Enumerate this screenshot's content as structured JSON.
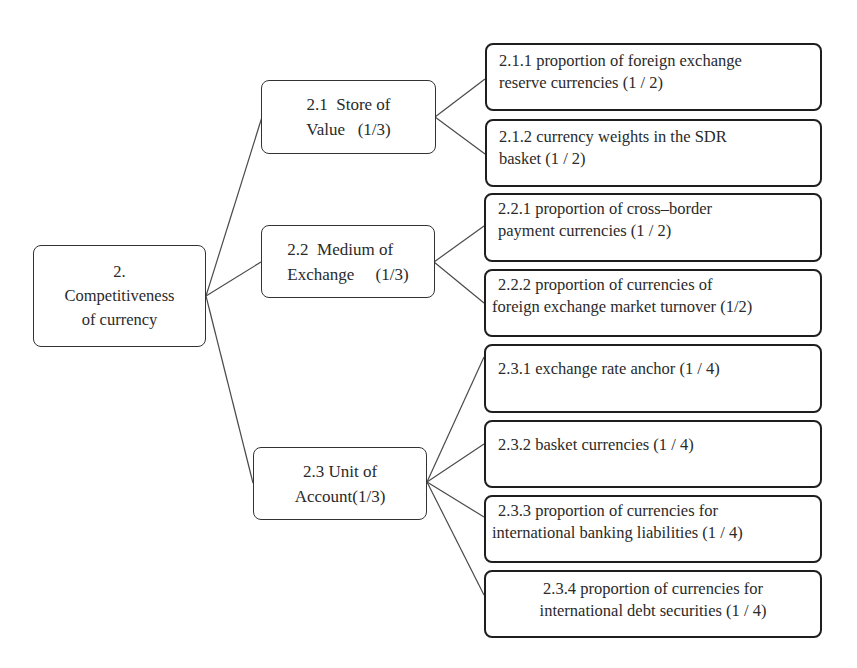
{
  "diagram": {
    "root": {
      "id": "2",
      "lines": [
        "2.",
        "Competitiveness",
        "of currency"
      ]
    },
    "branches": [
      {
        "id": "2.1",
        "lines": [
          "2.1  Store of",
          "Value   (1/3)"
        ],
        "label": "Store of Value",
        "weight": "1/3",
        "children": [
          {
            "id": "2.1.1",
            "lines": [
              "2.1.1 proportion of foreign exchange",
              "reserve currencies (1 / 2)"
            ],
            "weight": "1/2"
          },
          {
            "id": "2.1.2",
            "lines": [
              "2.1.2 currency weights in the SDR",
              "basket (1 / 2)"
            ],
            "weight": "1/2"
          }
        ]
      },
      {
        "id": "2.2",
        "lines": [
          "2.2  Medium of",
          "Exchange     (1/3)"
        ],
        "label": "Medium of Exchange",
        "weight": "1/3",
        "children": [
          {
            "id": "2.2.1",
            "lines": [
              "2.2.1 proportion of cross–border",
              "payment currencies (1 / 2)"
            ],
            "weight": "1/2"
          },
          {
            "id": "2.2.2",
            "lines": [
              "2.2.2 proportion of currencies of",
              "foreign exchange market turnover (1/2)"
            ],
            "weight": "1/2"
          }
        ]
      },
      {
        "id": "2.3",
        "lines": [
          "2.3 Unit of",
          "Account(1/3)"
        ],
        "label": "Unit of Account",
        "weight": "1/3",
        "children": [
          {
            "id": "2.3.1",
            "lines": [
              "2.3.1 exchange rate anchor (1 / 4)"
            ],
            "weight": "1/4"
          },
          {
            "id": "2.3.2",
            "lines": [
              "2.3.2 basket currencies (1 / 4)"
            ],
            "weight": "1/4"
          },
          {
            "id": "2.3.3",
            "lines": [
              "2.3.3 proportion of currencies for",
              "international banking liabilities (1 / 4)"
            ],
            "weight": "1/4"
          },
          {
            "id": "2.3.4",
            "lines": [
              "2.3.4 proportion of currencies for",
              "international debt securities (1 / 4)"
            ],
            "weight": "1/4"
          }
        ]
      }
    ],
    "colors": {
      "line": "#4a4a4a",
      "border": "#1e1e1e",
      "text": "#2a2a2a",
      "background": "#ffffff"
    }
  }
}
